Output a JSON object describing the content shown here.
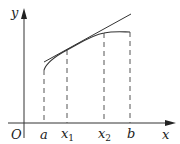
{
  "figure": {
    "axes": {
      "x_label": "x",
      "y_label": "y",
      "origin_label": "O"
    },
    "ticks": [
      {
        "name": "a",
        "base": "a",
        "sub": ""
      },
      {
        "name": "x1",
        "base": "x",
        "sub": "1"
      },
      {
        "name": "x2",
        "base": "x",
        "sub": "2"
      },
      {
        "name": "b",
        "base": "b",
        "sub": ""
      }
    ],
    "elements": [
      "concave curve from a to b",
      "tangent line touching curve near x1",
      "dashed vertical lines at a, x1, x2, b"
    ],
    "colors": {
      "stroke": "#333333",
      "dash": "#555555"
    }
  }
}
